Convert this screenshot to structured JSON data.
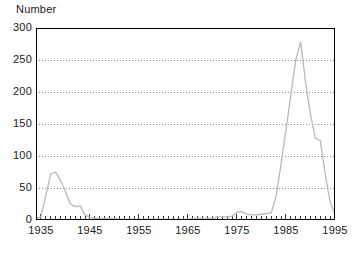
{
  "chart_data": {
    "type": "line",
    "title": "",
    "subtitle": "",
    "xlabel": "",
    "ylabel": "Number",
    "xlim": [
      1934,
      1995
    ],
    "ylim": [
      0,
      300
    ],
    "grid": "horizontal-dotted",
    "legend": "none",
    "yticks": [
      0,
      50,
      100,
      150,
      200,
      250,
      300
    ],
    "ytick_labels": [
      "0",
      "50",
      "100",
      "150",
      "200",
      "250",
      "300"
    ],
    "xticks": [
      1935,
      1945,
      1955,
      1965,
      1975,
      1985,
      1995
    ],
    "xtick_labels": [
      "1935",
      "1945",
      "1955",
      "1965",
      "1975",
      "1985",
      "1995"
    ],
    "minor_xtick_interval": 1,
    "line_color": "#b9b9b9",
    "axis_color": "#000000",
    "grid_color": "#888888",
    "series": [
      {
        "name": "Number",
        "x": [
          1934,
          1935,
          1936,
          1937,
          1938,
          1939,
          1940,
          1941,
          1942,
          1943,
          1944,
          1945,
          1946,
          1947,
          1948,
          1949,
          1950,
          1951,
          1952,
          1953,
          1954,
          1955,
          1956,
          1957,
          1958,
          1959,
          1960,
          1961,
          1962,
          1963,
          1964,
          1965,
          1966,
          1967,
          1968,
          1969,
          1970,
          1971,
          1972,
          1973,
          1974,
          1975,
          1976,
          1977,
          1978,
          1979,
          1980,
          1981,
          1982,
          1983,
          1984,
          1985,
          1986,
          1987,
          1988,
          1989,
          1990,
          1991,
          1992,
          1993,
          1994,
          1995
        ],
        "values": [
          2,
          5,
          38,
          72,
          75,
          62,
          45,
          25,
          21,
          22,
          8,
          4,
          3,
          2,
          2,
          2,
          2,
          1,
          1,
          1,
          1,
          1,
          1,
          1,
          1,
          1,
          1,
          1,
          1,
          1,
          1,
          1,
          2,
          3,
          3,
          3,
          3,
          4,
          5,
          5,
          6,
          12,
          13,
          9,
          8,
          8,
          9,
          10,
          11,
          38,
          88,
          140,
          196,
          250,
          278,
          215,
          165,
          128,
          124,
          72,
          28,
          8
        ]
      }
    ]
  }
}
